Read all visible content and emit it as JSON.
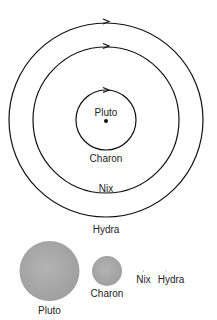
{
  "diagram": {
    "orbits": [
      {
        "name": "Charon",
        "label": "Charon",
        "r": 30,
        "label_y": 162
      },
      {
        "name": "Nix",
        "label": "Nix",
        "r": 73,
        "label_y": 193
      },
      {
        "name": "Hydra",
        "label": "Hydra",
        "r": 97,
        "label_y": 233
      }
    ],
    "center": {
      "label": "Pluto",
      "x": 106,
      "y": 120
    },
    "size_comparison": [
      {
        "name": "Pluto",
        "label": "Pluto",
        "r": 30
      },
      {
        "name": "Charon",
        "label": "Charon",
        "r": 15
      },
      {
        "name": "Nix",
        "label": "Nix",
        "r": 0.5
      },
      {
        "name": "Hydra",
        "label": "Hydra",
        "r": 0.5
      }
    ],
    "colors": {
      "line": "#111111",
      "disk": "#a8a8a8",
      "text": "#222222"
    }
  }
}
